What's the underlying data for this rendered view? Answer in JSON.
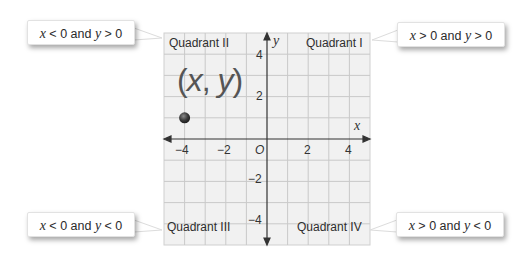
{
  "diagram": {
    "type": "coordinate-plane",
    "quadrants": [
      {
        "name": "Quadrant I",
        "condition": "x > 0 and y > 0",
        "condition_parts": [
          "x",
          " > 0 and ",
          "y",
          " > 0"
        ]
      },
      {
        "name": "Quadrant II",
        "condition": "x < 0 and y > 0",
        "condition_parts": [
          "x",
          " < 0 and ",
          "y",
          " > 0"
        ]
      },
      {
        "name": "Quadrant III",
        "condition": "x < 0 and y < 0",
        "condition_parts": [
          "x",
          " < 0 and ",
          "y",
          " < 0"
        ]
      },
      {
        "name": "Quadrant IV",
        "condition": "x > 0 and y < 0",
        "condition_parts": [
          "x",
          " > 0 and ",
          "y",
          " < 0"
        ]
      }
    ],
    "axes": {
      "x_label": "x",
      "y_label": "y",
      "origin_label": "O",
      "x_ticks": [
        "−4",
        "−2",
        "2",
        "4"
      ],
      "y_ticks": [
        "4",
        "2",
        "−2",
        "−4"
      ],
      "range": {
        "x": [
          -5,
          5
        ],
        "y": [
          -5,
          5
        ]
      }
    },
    "point": {
      "label": "(x, y)",
      "label_parts": [
        "(",
        "x",
        ", ",
        "y",
        ")"
      ],
      "coords": [
        -4,
        1
      ],
      "color": "#3a3a3a"
    },
    "colors": {
      "grid_background": "#f1f1f1",
      "grid_lines": "#c8c8c8",
      "axis": "#333333"
    }
  }
}
